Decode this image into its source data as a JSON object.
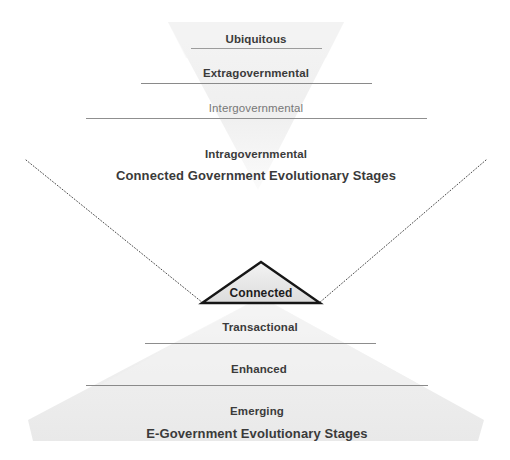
{
  "diagram": {
    "title_alt": "Connected Government and E-Government Evolutionary Stages",
    "colors": {
      "pyramid_fill_top": "#f1f1f1",
      "pyramid_fill_bottom": "#ededed",
      "divider_line": "#8f8f8f",
      "dotted_line": "#555555",
      "triangle_outline": "#111111",
      "triangle_fill": "#e4e4e4",
      "text": "#3b3b3b",
      "text_muted": "#777777"
    },
    "top_pyramid": {
      "name": "connected-government-pyramid",
      "orientation": "inverted",
      "caption": "Connected Government Evolutionary Stages",
      "tiers": [
        {
          "label": "Ubiquitous",
          "style": "bold"
        },
        {
          "label": "Extragovernmental",
          "style": "bold"
        },
        {
          "label": "Intergovernmental",
          "style": "muted"
        },
        {
          "label": "Intragovernmental",
          "style": "bold"
        }
      ]
    },
    "apex": {
      "name": "connected-stage-triangle",
      "label": "Connected"
    },
    "bottom_pyramid": {
      "name": "e-government-pyramid",
      "orientation": "upright",
      "caption": "E-Government  Evolutionary Stages",
      "tiers": [
        {
          "label": "Transactional",
          "style": "bold"
        },
        {
          "label": "Enhanced",
          "style": "bold"
        },
        {
          "label": "Emerging",
          "style": "bold"
        }
      ]
    }
  }
}
